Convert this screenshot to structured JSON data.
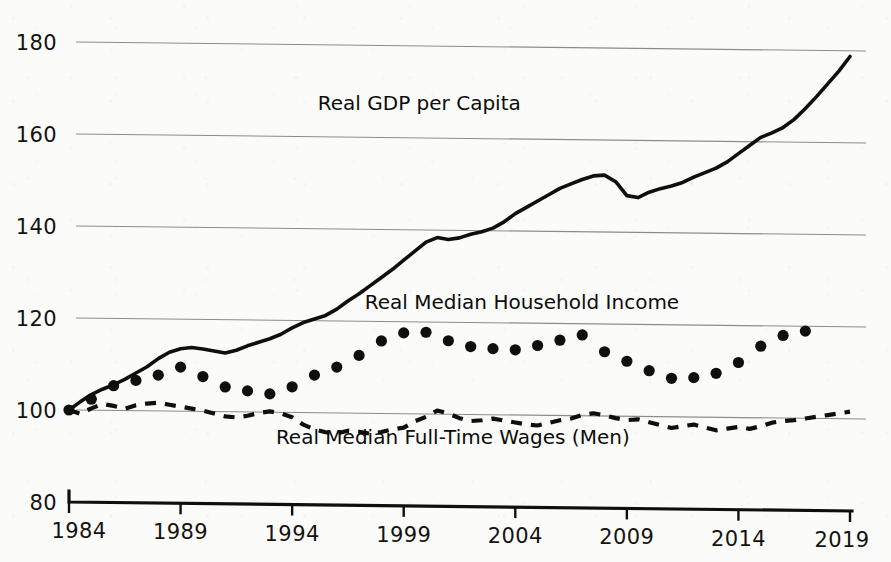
{
  "chart_data": {
    "type": "line",
    "title": "",
    "subtitle": "",
    "xlabel": "",
    "ylabel": "",
    "xlim": [
      1984,
      2019
    ],
    "ylim": [
      80,
      180
    ],
    "grid": true,
    "grid_axis": "y",
    "legend_position": "inline-annotations",
    "index_base": "1984 = 100",
    "y_ticks": [
      180,
      160,
      140,
      120,
      100,
      80
    ],
    "x_ticks": [
      1984,
      1989,
      1994,
      1999,
      2004,
      2009,
      2014,
      2019
    ],
    "series": [
      {
        "name": "Real GDP per Capita",
        "style": "solid-line",
        "label_x": 1999.7,
        "label_y": 166,
        "x": [
          1984,
          1984.5,
          1985,
          1985.5,
          1986,
          1986.5,
          1987,
          1987.5,
          1988,
          1988.5,
          1989,
          1989.5,
          1990,
          1990.5,
          1991,
          1991.5,
          1992,
          1992.5,
          1993,
          1993.5,
          1994,
          1994.5,
          1995,
          1995.5,
          1996,
          1996.5,
          1997,
          1997.5,
          1998,
          1998.5,
          1999,
          1999.5,
          2000,
          2000.5,
          2001,
          2001.5,
          2002,
          2002.5,
          2003,
          2003.5,
          2004,
          2004.5,
          2005,
          2005.5,
          2006,
          2006.5,
          2007,
          2007.5,
          2008,
          2008.5,
          2009,
          2009.5,
          2010,
          2010.5,
          2011,
          2011.5,
          2012,
          2012.5,
          2013,
          2013.5,
          2014,
          2014.5,
          2015,
          2015.5,
          2016,
          2016.5,
          2017,
          2017.5,
          2018,
          2018.5,
          2019
        ],
        "y": [
          100,
          101.8,
          103.4,
          104.6,
          105.6,
          106.8,
          108.2,
          109.6,
          111.4,
          112.8,
          113.6,
          113.9,
          113.6,
          113.2,
          112.8,
          113.4,
          114.4,
          115.2,
          116.0,
          117.0,
          118.4,
          119.6,
          120.4,
          121.2,
          122.6,
          124.4,
          126.0,
          127.8,
          129.6,
          131.4,
          133.4,
          135.4,
          137.4,
          138.4,
          138.0,
          138.4,
          139.2,
          139.8,
          140.6,
          142.0,
          143.8,
          145.2,
          146.6,
          148.0,
          149.4,
          150.4,
          151.4,
          152.2,
          152.4,
          151.0,
          148.0,
          147.6,
          148.8,
          149.6,
          150.2,
          151.0,
          152.2,
          153.2,
          154.2,
          155.6,
          157.4,
          159.2,
          161.0,
          162.0,
          163.2,
          165.0,
          167.4,
          170.0,
          172.8,
          175.6,
          178.8
        ]
      },
      {
        "name": "Real Median Household Income",
        "style": "dotted-markers",
        "label_x": 2004.3,
        "label_y": 123,
        "x": [
          1984,
          1985,
          1986,
          1987,
          1988,
          1989,
          1990,
          1991,
          1992,
          1993,
          1994,
          1995,
          1996,
          1997,
          1998,
          1999,
          2000,
          2001,
          2002,
          2003,
          2004,
          2005,
          2006,
          2007,
          2008,
          2009,
          2010,
          2011,
          2012,
          2013,
          2014,
          2015,
          2016,
          2017
        ],
        "y": [
          100.0,
          102.4,
          105.4,
          106.6,
          107.8,
          109.6,
          107.6,
          105.4,
          104.6,
          104.0,
          105.6,
          108.2,
          110.0,
          112.6,
          115.8,
          117.6,
          117.8,
          116.0,
          114.8,
          114.4,
          114.2,
          115.2,
          116.4,
          117.6,
          114.0,
          112.0,
          110.0,
          108.4,
          108.6,
          109.6,
          112.0,
          115.6,
          118.0,
          119.0
        ]
      },
      {
        "name": "Real Median Full-Time Wages (Men)",
        "style": "dashed-line",
        "label_x": 2001.2,
        "label_y": 93.5,
        "x": [
          1984,
          1984.5,
          1985,
          1985.5,
          1986,
          1986.5,
          1987,
          1987.5,
          1988,
          1988.5,
          1989,
          1989.5,
          1990,
          1990.5,
          1991,
          1991.5,
          1992,
          1992.5,
          1993,
          1993.5,
          1994,
          1994.5,
          1995,
          1995.5,
          1996,
          1996.5,
          1997,
          1997.5,
          1998,
          1998.5,
          1999,
          1999.5,
          2000,
          2000.5,
          2001,
          2001.5,
          2002,
          2002.5,
          2003,
          2003.5,
          2004,
          2004.5,
          2005,
          2005.5,
          2006,
          2006.5,
          2007,
          2007.5,
          2008,
          2008.5,
          2009,
          2009.5,
          2010,
          2010.5,
          2011,
          2011.5,
          2012,
          2012.5,
          2013,
          2013.5,
          2014,
          2014.5,
          2015,
          2015.5,
          2016,
          2016.5,
          2017,
          2017.5,
          2018,
          2018.5,
          2019
        ],
        "y": [
          100.0,
          99.2,
          100.4,
          101.4,
          101.0,
          100.4,
          101.2,
          101.6,
          101.8,
          101.4,
          101.0,
          100.6,
          100.2,
          99.6,
          99.0,
          98.8,
          99.2,
          99.8,
          100.2,
          99.8,
          99.0,
          97.4,
          96.4,
          95.8,
          95.6,
          96.2,
          96.0,
          95.6,
          96.0,
          96.6,
          97.0,
          98.4,
          99.4,
          100.8,
          100.2,
          99.2,
          98.6,
          98.8,
          99.2,
          98.8,
          98.4,
          98.0,
          97.8,
          98.4,
          99.0,
          99.4,
          100.2,
          100.6,
          100.2,
          99.6,
          99.2,
          99.4,
          98.8,
          98.2,
          97.6,
          98.0,
          98.4,
          97.8,
          97.2,
          97.6,
          98.0,
          97.6,
          98.2,
          99.0,
          99.4,
          99.6,
          100.0,
          100.4,
          100.8,
          101.2,
          101.6
        ]
      }
    ]
  },
  "axes": {
    "y_labels": [
      "180",
      "160",
      "140",
      "120",
      "100",
      "80"
    ],
    "x_labels": [
      "1984",
      "1989",
      "1994",
      "1999",
      "2004",
      "2009",
      "2014",
      "2019"
    ]
  },
  "annotations": {
    "gdp": "Real GDP per Capita",
    "income": "Real Median Household Income",
    "wages": "Real Median Full-Time Wages (Men)"
  },
  "colors": {
    "ink": "#100f0d",
    "grid": "#8d8d88",
    "background": "#fbfbfa"
  }
}
